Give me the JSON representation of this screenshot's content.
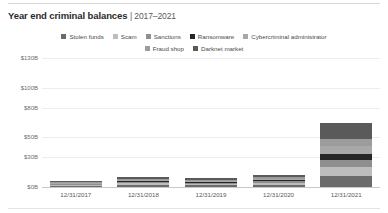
{
  "header": {
    "title": "Year end criminal balances",
    "subtitle": "| 2017–2021"
  },
  "chart_data": {
    "type": "bar",
    "title": "Year end criminal balances | 2017–2021",
    "subtitle": "2017–2021",
    "stacked": true,
    "xlabel": "",
    "ylabel": "",
    "grid": true,
    "legend_position": "top",
    "ylim": [
      0,
      130
    ],
    "yticks": [
      0,
      30,
      50,
      80,
      100,
      130
    ],
    "ytick_labels": [
      "$0B",
      "$30B",
      "$50B",
      "$80B",
      "$100B",
      "$130B"
    ],
    "categories": [
      "12/31/2017",
      "12/31/2018",
      "12/31/2019",
      "12/31/2020",
      "12/31/2021"
    ],
    "series": [
      {
        "name": "Stolen funds",
        "color": "#6b6b6b",
        "values": [
          1.2,
          2.0,
          1.8,
          2.4,
          11.0
        ]
      },
      {
        "name": "Scam",
        "color": "#bdbdbd",
        "values": [
          1.0,
          1.6,
          1.5,
          2.0,
          9.0
        ]
      },
      {
        "name": "Sanctions",
        "color": "#8f8f8f",
        "values": [
          0.8,
          1.2,
          1.1,
          1.6,
          7.5
        ]
      },
      {
        "name": "Ransomware",
        "color": "#262626",
        "values": [
          0.5,
          0.9,
          0.8,
          1.2,
          6.0
        ]
      },
      {
        "name": "Cybercriminal administrator",
        "color": "#a8a8a8",
        "values": [
          0.7,
          1.1,
          1.0,
          1.4,
          8.0
        ]
      },
      {
        "name": "Fraud shop",
        "color": "#9c9c9c",
        "values": [
          0.6,
          1.0,
          0.9,
          1.3,
          7.0
        ]
      },
      {
        "name": "Darknet market",
        "color": "#5a5a5a",
        "values": [
          1.2,
          2.2,
          2.0,
          2.6,
          16.5
        ]
      }
    ],
    "totals": [
      6.0,
      10.0,
      9.1,
      12.5,
      65.0
    ]
  },
  "colors": {
    "grid": "#ededed",
    "axis": "#c9c9c9",
    "text": "#4a4a4a"
  }
}
